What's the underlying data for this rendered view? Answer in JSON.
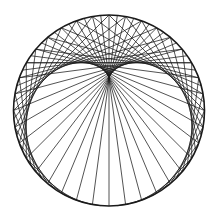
{
  "diagram": {
    "type": "string-art-cardioid",
    "canvas": {
      "width": 214,
      "height": 213,
      "background": "#ffffff"
    },
    "circle": {
      "cx": 109,
      "cy": 110.5,
      "r": 95.5,
      "stroke": "#1a1a1a",
      "stroke_width": 1.6
    },
    "chords": {
      "points": 72,
      "multiplier": 2,
      "start_angle_deg": -90,
      "stroke": "#1a1a1a",
      "stroke_width": 0.75
    }
  }
}
